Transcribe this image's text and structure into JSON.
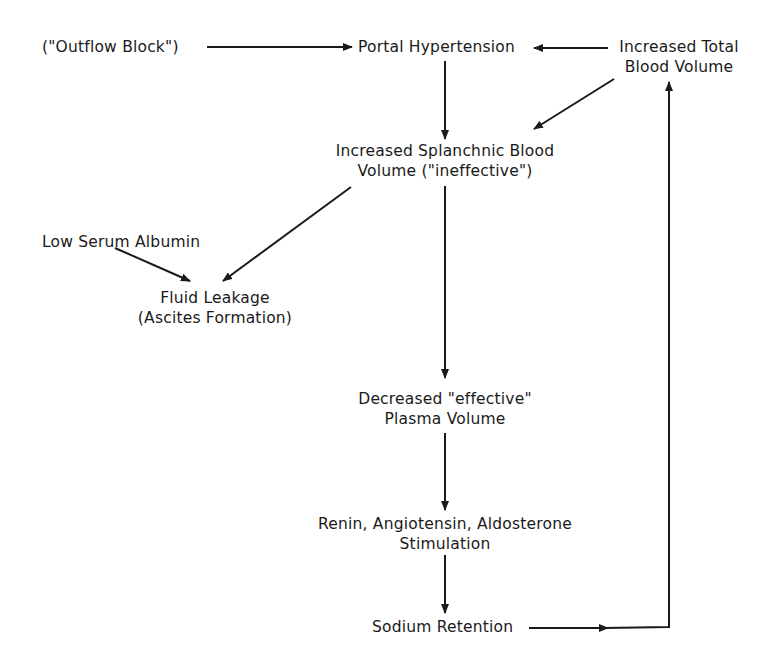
{
  "diagram": {
    "nodes": {
      "outflow_block": {
        "lines": [
          "(\"Outflow Block\")"
        ]
      },
      "portal_hypertension": {
        "lines": [
          "Portal Hypertension"
        ]
      },
      "increased_total_blood_volume": {
        "lines": [
          "Increased Total",
          "Blood Volume"
        ]
      },
      "increased_splanchnic_blood_volume": {
        "lines": [
          "Increased Splanchnic Blood",
          "Volume (\"ineffective\")"
        ]
      },
      "low_serum_albumin": {
        "lines": [
          "Low Serum Albumin"
        ]
      },
      "fluid_leakage": {
        "lines": [
          "Fluid Leakage",
          "(Ascites Formation)"
        ]
      },
      "decreased_effective_plasma_volume": {
        "lines": [
          "Decreased \"effective\"",
          "Plasma Volume"
        ]
      },
      "renin_angiotensin_aldosterone": {
        "lines": [
          "Renin, Angiotensin, Aldosterone",
          "Stimulation"
        ]
      },
      "sodium_retention": {
        "lines": [
          "Sodium Retention"
        ]
      }
    },
    "edges": [
      {
        "from": "outflow_block",
        "to": "portal_hypertension"
      },
      {
        "from": "increased_total_blood_volume",
        "to": "portal_hypertension"
      },
      {
        "from": "increased_total_blood_volume",
        "to": "increased_splanchnic_blood_volume"
      },
      {
        "from": "portal_hypertension",
        "to": "increased_splanchnic_blood_volume"
      },
      {
        "from": "increased_splanchnic_blood_volume",
        "to": "fluid_leakage"
      },
      {
        "from": "low_serum_albumin",
        "to": "fluid_leakage"
      },
      {
        "from": "increased_splanchnic_blood_volume",
        "to": "decreased_effective_plasma_volume"
      },
      {
        "from": "decreased_effective_plasma_volume",
        "to": "renin_angiotensin_aldosterone"
      },
      {
        "from": "renin_angiotensin_aldosterone",
        "to": "sodium_retention"
      },
      {
        "from": "sodium_retention",
        "to": "increased_total_blood_volume"
      }
    ],
    "colors": {
      "ink": "#1a1a1a",
      "background": "#ffffff"
    }
  }
}
